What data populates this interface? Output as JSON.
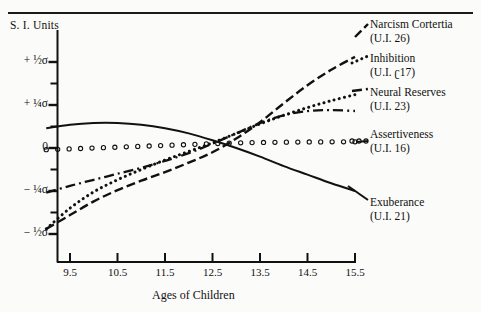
{
  "header": {
    "cropped_line": "",
    "si_units_label": "S. I. Units"
  },
  "axes": {
    "x_title": "Ages of Children",
    "x_ticks": [
      "9.5",
      "10.5",
      "11.5",
      "12.5",
      "13.5",
      "14.5",
      "15.5"
    ],
    "y_ticks": [
      "+ ½σ",
      "+ ¼σ",
      "0",
      "− ¼σ",
      "− ½σ"
    ]
  },
  "legend": [
    {
      "name": "Narcism Cortertia",
      "ui": "(U.I. 26)",
      "style": "dash-long"
    },
    {
      "name": "Inhibition",
      "ui": "(U.I. ʗ17)",
      "style": "dotted"
    },
    {
      "name": "Neural Reserves",
      "ui": "(U.I. 23)",
      "style": "dash-dot"
    },
    {
      "name": "Assertiveness",
      "ui": "(U.I. 16)",
      "style": "circles"
    },
    {
      "name": "Exuberance",
      "ui": "(U.I. 21)",
      "style": "solid"
    }
  ],
  "chart_data": {
    "type": "line",
    "title": "",
    "xlabel": "Ages of Children",
    "ylabel": "S. I. Units",
    "xlim": [
      9.0,
      15.5
    ],
    "ylim": [
      -0.5,
      0.5
    ],
    "grid": false,
    "legend_position": "right",
    "x": [
      9.0,
      9.5,
      10.0,
      10.5,
      11.0,
      11.5,
      12.0,
      12.5,
      13.0,
      13.5,
      14.0,
      14.5,
      15.0,
      15.5
    ],
    "series": [
      {
        "name": "Narcism Cortertia",
        "ui": "(U.I. 26)",
        "style": "dash-long",
        "values": [
          -0.47,
          -0.39,
          -0.31,
          -0.245,
          -0.19,
          -0.14,
          -0.085,
          -0.025,
          0.055,
          0.15,
          0.26,
          0.365,
          0.455,
          0.53
        ]
      },
      {
        "name": "Inhibition",
        "ui": "(U.I. 17)",
        "style": "dotted",
        "values": [
          -0.47,
          -0.35,
          -0.255,
          -0.185,
          -0.125,
          -0.07,
          -0.02,
          0.03,
          0.085,
          0.14,
          0.19,
          0.235,
          0.275,
          0.31
        ]
      },
      {
        "name": "Neural Reserves",
        "ui": "(U.I. 23)",
        "style": "dash-dot",
        "values": [
          -0.26,
          -0.22,
          -0.185,
          -0.15,
          -0.115,
          -0.075,
          -0.03,
          0.025,
          0.085,
          0.145,
          0.19,
          0.215,
          0.22,
          0.215
        ]
      },
      {
        "name": "Assertiveness",
        "ui": "(U.I. 16)",
        "style": "circles",
        "values": [
          -0.01,
          -0.005,
          0.0,
          0.005,
          0.01,
          0.015,
          0.02,
          0.025,
          0.03,
          0.032,
          0.034,
          0.035,
          0.036,
          0.036
        ]
      },
      {
        "name": "Exuberance",
        "ui": "(U.I. 21)",
        "style": "solid",
        "values": [
          0.115,
          0.135,
          0.145,
          0.145,
          0.135,
          0.115,
          0.085,
          0.045,
          0.0,
          -0.05,
          -0.105,
          -0.155,
          -0.205,
          -0.25
        ]
      }
    ]
  }
}
